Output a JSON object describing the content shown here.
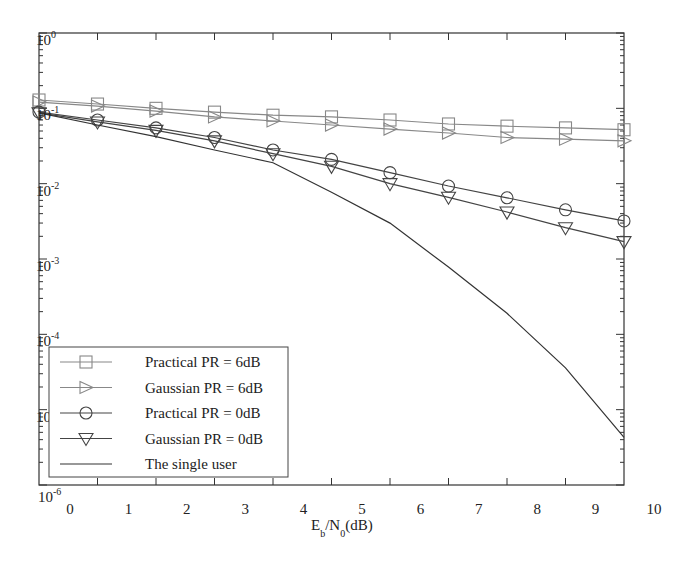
{
  "chart_data": {
    "type": "line",
    "title": "",
    "xlabel": "E_b/N_0 (dB)",
    "xlabel_parts": {
      "main1": "E",
      "sub1": "b",
      "main2": "/N",
      "sub2": "0",
      "tail": "(dB)"
    },
    "ylabel": "",
    "y_scale": "log",
    "xlim": [
      0,
      10
    ],
    "ylim": [
      1e-06,
      1
    ],
    "grid": false,
    "legend_position": "lower left",
    "x_tick_labels": [
      "0",
      "1",
      "2",
      "3",
      "4",
      "5",
      "6",
      "7",
      "8",
      "9",
      "10"
    ],
    "y_tick_labels": [
      {
        "base": "10",
        "exp": "0"
      },
      {
        "base": "10",
        "exp": "-1"
      },
      {
        "base": "10",
        "exp": "-2"
      },
      {
        "base": "10",
        "exp": "-3"
      },
      {
        "base": "10",
        "exp": "-4"
      },
      {
        "base": "10",
        "exp": "-5"
      },
      {
        "base": "10",
        "exp": "-6"
      }
    ],
    "x": [
      0,
      1,
      2,
      3,
      4,
      5,
      6,
      7,
      8,
      9,
      10
    ],
    "series": [
      {
        "name": "Practical PR = 6dB",
        "marker": "square",
        "color": "#888888",
        "values": [
          0.129,
          0.114,
          0.1,
          0.089,
          0.081,
          0.077,
          0.07,
          0.062,
          0.058,
          0.055,
          0.052
        ]
      },
      {
        "name": "Gaussian PR = 6dB",
        "marker": "triangle-right",
        "color": "#888888",
        "values": [
          0.121,
          0.107,
          0.092,
          0.077,
          0.068,
          0.06,
          0.053,
          0.047,
          0.041,
          0.039,
          0.037
        ]
      },
      {
        "name": "Practical PR = 0dB",
        "marker": "circle",
        "color": "#444444",
        "values": [
          0.089,
          0.07,
          0.055,
          0.041,
          0.028,
          0.021,
          0.014,
          0.0093,
          0.0065,
          0.0045,
          0.0032
        ]
      },
      {
        "name": "Gaussian PR = 0dB",
        "marker": "triangle-down",
        "color": "#444444",
        "values": [
          0.087,
          0.066,
          0.051,
          0.037,
          0.025,
          0.017,
          0.01,
          0.0066,
          0.0042,
          0.0026,
          0.0017
        ]
      },
      {
        "name": "The single user",
        "marker": "none",
        "color": "#333333",
        "values": [
          0.087,
          0.06,
          0.042,
          0.028,
          0.019,
          0.0077,
          0.003,
          0.00078,
          0.00019,
          3.6e-05,
          4.3e-06
        ]
      }
    ]
  },
  "legend": {
    "items": [
      {
        "label": "Practical PR = 6dB"
      },
      {
        "label": "Gaussian PR = 6dB"
      },
      {
        "label": "Practical PR = 0dB"
      },
      {
        "label": "Gaussian PR = 0dB"
      },
      {
        "label": "The single user"
      }
    ]
  }
}
